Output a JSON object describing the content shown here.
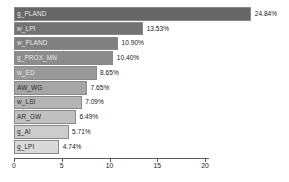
{
  "chart_data": {
    "type": "bar",
    "orientation": "horizontal",
    "title": "",
    "subtitle": "",
    "xlabel": "",
    "ylabel": "",
    "xlim": [
      0,
      22.5
    ],
    "grid": false,
    "legend": false,
    "axis_ticks": [
      "0",
      "5",
      "10",
      "15",
      "20"
    ],
    "axis_tick_values": [
      0,
      5,
      10,
      15,
      20
    ],
    "categories": [
      "g_PLAND",
      "w_LPI",
      "w_PLAND",
      "g_PROX_MN",
      "w_ED",
      "AW_WG",
      "w_LSI",
      "AR_GW",
      "g_AI",
      "g_LPI"
    ],
    "values": [
      24.84,
      13.53,
      10.9,
      10.4,
      8.65,
      7.65,
      7.09,
      6.49,
      5.71,
      4.74
    ],
    "value_labels": [
      "24.84%",
      "13.53%",
      "10.90%",
      "10.40%",
      "8.65%",
      "7.65%",
      "7.09%",
      "6.49%",
      "5.71%",
      "4.74%"
    ],
    "bar_colors": [
      "#666666",
      "#737373",
      "#808080",
      "#8c8c8c",
      "#999999",
      "#a6a6a6",
      "#b3b3b3",
      "#c0c0c0",
      "#cccccc",
      "#d9d9d9"
    ],
    "bar_border_color": "#8a8a8a",
    "axis_color": "#5a5a5a",
    "background_color": "#ffffff"
  }
}
